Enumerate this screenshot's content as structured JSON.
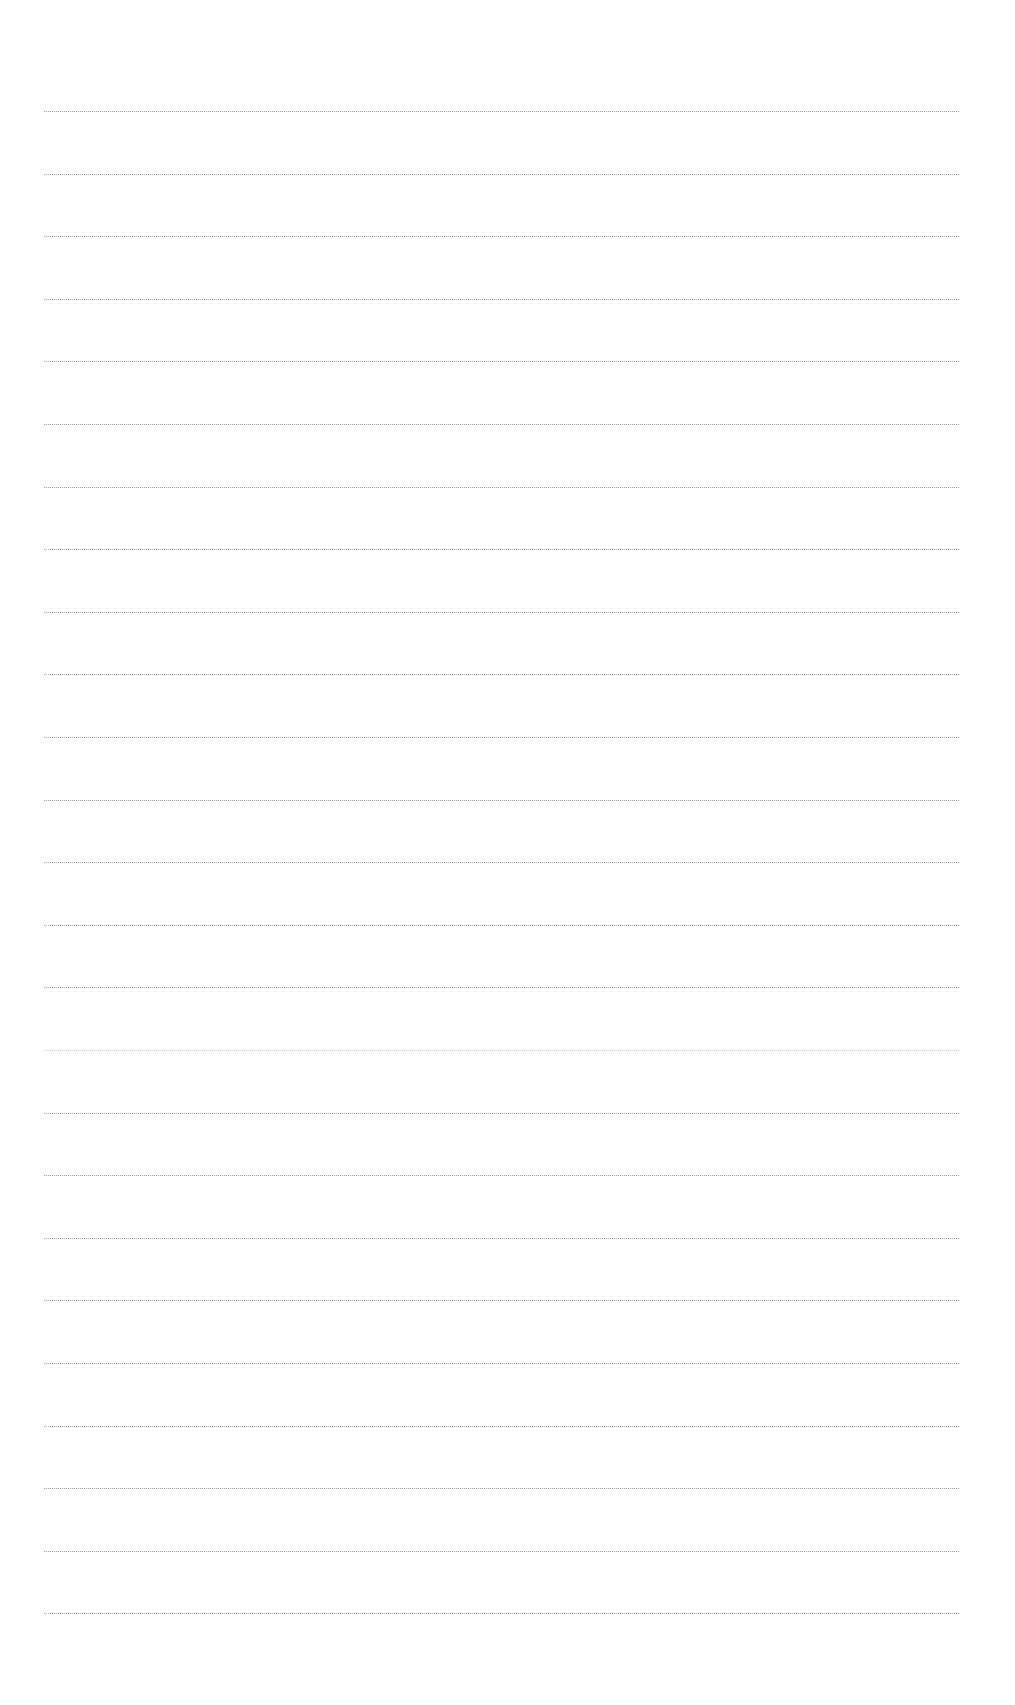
{
  "page": {
    "kind": "blank lined paper",
    "background": "#ffffff",
    "line_color": "#8a8a8a",
    "line_count": 25,
    "first_line_y": 111,
    "line_spacing": 62.6,
    "line_left": 44,
    "line_right": 959,
    "faded_lines": [
      15
    ]
  }
}
